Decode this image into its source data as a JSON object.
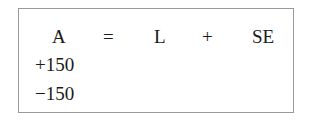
{
  "equation": {
    "header": {
      "assets": "A",
      "equals": "=",
      "liabilities": "L",
      "plus": "+",
      "equity": "SE"
    },
    "rows": [
      {
        "assets": "+150"
      },
      {
        "assets": "−150"
      }
    ]
  }
}
